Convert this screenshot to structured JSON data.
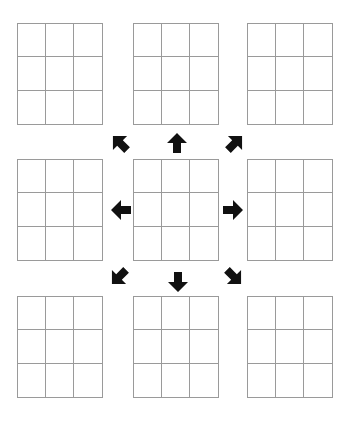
{
  "diagram": {
    "colors": {
      "grid_line": "#9a9a9a",
      "arrow": "#111111",
      "background": "#ffffff"
    },
    "grids": [
      {
        "id": "top-left",
        "x": 17,
        "y": 23
      },
      {
        "id": "top-center",
        "x": 133,
        "y": 23
      },
      {
        "id": "top-right",
        "x": 247,
        "y": 23
      },
      {
        "id": "middle-left",
        "x": 17,
        "y": 159
      },
      {
        "id": "center",
        "x": 133,
        "y": 159
      },
      {
        "id": "middle-right",
        "x": 247,
        "y": 159
      },
      {
        "id": "bottom-left",
        "x": 17,
        "y": 296
      },
      {
        "id": "bottom-center",
        "x": 133,
        "y": 296
      },
      {
        "id": "bottom-right",
        "x": 247,
        "y": 296
      }
    ],
    "arrows": [
      {
        "direction": "north-west",
        "icon": "arrow-up-left-icon",
        "x": 109,
        "y": 132,
        "rotation": -45
      },
      {
        "direction": "north",
        "icon": "arrow-up-icon",
        "x": 166,
        "y": 132,
        "rotation": 0
      },
      {
        "direction": "north-east",
        "icon": "arrow-up-right-icon",
        "x": 224,
        "y": 132,
        "rotation": 45
      },
      {
        "direction": "west",
        "icon": "arrow-left-icon",
        "x": 110,
        "y": 199,
        "rotation": -90
      },
      {
        "direction": "east",
        "icon": "arrow-right-icon",
        "x": 222,
        "y": 199,
        "rotation": 90
      },
      {
        "direction": "south-west",
        "icon": "arrow-down-left-icon",
        "x": 108,
        "y": 266,
        "rotation": -135
      },
      {
        "direction": "south",
        "icon": "arrow-down-icon",
        "x": 167,
        "y": 271,
        "rotation": 180
      },
      {
        "direction": "south-east",
        "icon": "arrow-down-right-icon",
        "x": 223,
        "y": 266,
        "rotation": 135
      }
    ]
  }
}
